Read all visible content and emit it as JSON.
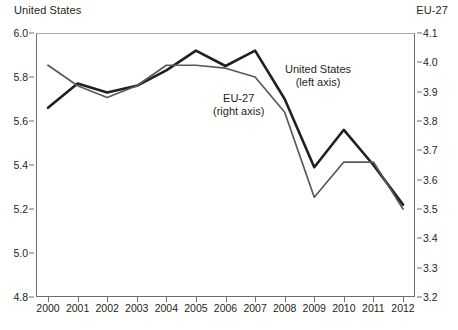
{
  "axis_titles": {
    "left": "United States",
    "right": "EU-27"
  },
  "annotations": {
    "us": {
      "line1": "United States",
      "line2": "(left axis)"
    },
    "eu": {
      "line1": "EU-27",
      "line2": "(right axis)"
    }
  },
  "colors": {
    "us_line": "#231f20",
    "eu_line": "#58595b",
    "axis": "#6d6e70",
    "text": "#231f20"
  },
  "chart_data": {
    "type": "line",
    "title": "",
    "xlabel": "",
    "ylabel": "United States",
    "y2label": "EU-27",
    "grid": false,
    "legend": "inline-annotations",
    "x": [
      2000,
      2001,
      2002,
      2003,
      2004,
      2005,
      2006,
      2007,
      2008,
      2009,
      2010,
      2011,
      2012
    ],
    "xtick_labels": [
      "2000",
      "2001",
      "2002",
      "2003",
      "2004",
      "2005",
      "2006",
      "2007",
      "2008",
      "2009",
      "2010",
      "2011",
      "2012"
    ],
    "ylim": [
      4.8,
      6.0
    ],
    "ytick_labels": [
      "6.0",
      "5.8",
      "5.6",
      "5.4",
      "5.2",
      "5.0",
      "4.8"
    ],
    "ytick_values": [
      6.0,
      5.8,
      5.6,
      5.4,
      5.2,
      5.0,
      4.8
    ],
    "y2lim": [
      3.2,
      4.1
    ],
    "y2tick_labels": [
      "4.1",
      "4.0",
      "3.9",
      "3.8",
      "3.7",
      "3.6",
      "3.5",
      "3.4",
      "3.3",
      "3.2"
    ],
    "y2tick_values": [
      4.1,
      4.0,
      3.9,
      3.8,
      3.7,
      3.6,
      3.5,
      3.4,
      3.3,
      3.2
    ],
    "series": [
      {
        "name": "United States",
        "axis": "left",
        "color": "#231f20",
        "values": [
          5.66,
          5.77,
          5.73,
          5.76,
          5.83,
          5.92,
          5.85,
          5.92,
          5.7,
          5.39,
          5.56,
          5.4,
          5.22
        ]
      },
      {
        "name": "EU-27",
        "axis": "right",
        "color": "#58595b",
        "values": [
          3.99,
          3.92,
          3.88,
          3.92,
          3.99,
          3.99,
          3.98,
          3.95,
          3.83,
          3.54,
          3.66,
          3.66,
          3.5
        ]
      }
    ]
  }
}
